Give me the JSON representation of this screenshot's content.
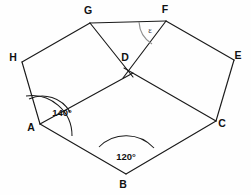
{
  "figure": {
    "type": "geometry-diagram",
    "background_color": "#fefefe",
    "stroke_color": "#1a1a1a",
    "arc_gray_color": "#8e8e8e"
  },
  "vertices": [
    {
      "id": "G",
      "label": "G",
      "x": 90,
      "y": 23,
      "label_x": 88,
      "label_y": 14
    },
    {
      "id": "F",
      "label": "F",
      "x": 166,
      "y": 21,
      "label_x": 165,
      "label_y": 13
    },
    {
      "id": "H",
      "label": "H",
      "x": 22,
      "y": 62,
      "label_x": 13,
      "label_y": 61
    },
    {
      "id": "E",
      "label": "E",
      "x": 234,
      "y": 60,
      "label_x": 238,
      "label_y": 59
    },
    {
      "id": "D",
      "label": "D",
      "x": 129,
      "y": 71,
      "label_x": 125,
      "label_y": 61
    },
    {
      "id": "A",
      "label": "A",
      "x": 40,
      "y": 124,
      "label_x": 31,
      "label_y": 131
    },
    {
      "id": "C",
      "label": "C",
      "x": 216,
      "y": 121,
      "label_x": 222,
      "label_y": 127
    },
    {
      "id": "B",
      "label": "B",
      "x": 126,
      "y": 174,
      "label_x": 123,
      "label_y": 188
    }
  ],
  "edges": [
    {
      "name": "edge-G-F",
      "from": "G",
      "to": "F"
    },
    {
      "name": "edge-H-G",
      "from": "H",
      "to": "G"
    },
    {
      "name": "edge-F-E",
      "from": "F",
      "to": "E"
    },
    {
      "name": "edge-H-A",
      "from": "H",
      "to": "A"
    },
    {
      "name": "edge-E-C",
      "from": "E",
      "to": "C"
    },
    {
      "name": "edge-A-B",
      "from": "A",
      "to": "B"
    },
    {
      "name": "edge-B-C",
      "from": "B",
      "to": "C"
    }
  ],
  "diagonals": [
    {
      "name": "diagonal-G-D",
      "from": "G",
      "to": "D"
    },
    {
      "name": "diagonal-F-D",
      "from": "F",
      "to": "D"
    },
    {
      "name": "diagonal-A-D",
      "from": "A",
      "to": "D"
    },
    {
      "name": "diagonal-D-C",
      "from": "D",
      "to": "C"
    }
  ],
  "angles": [
    {
      "name": "angle-at-A-inner",
      "vertex": "A",
      "label": "140°",
      "label_x": 62,
      "label_y": 116,
      "arc_path": "M 29 99 A 32 32 0 0 1 70 112",
      "style": "dark"
    },
    {
      "name": "angle-at-A-outer",
      "vertex": "A",
      "label": "",
      "arc_path": "M 26 96 A 40 40 0 0 1 72 136",
      "style": "dark"
    },
    {
      "name": "angle-at-B",
      "vertex": "B",
      "label": "120°",
      "label_x": 126,
      "label_y": 160,
      "arc_path": "M 99 147 A 38 38 0 0 1 154 148",
      "style": "dark"
    },
    {
      "name": "angle-at-F-epsilon",
      "vertex": "F",
      "label": "ε",
      "label_x": 150,
      "label_y": 33,
      "arc_path": "M 139 22 A 28 28 0 0 0 152 44",
      "style": "gray"
    }
  ]
}
